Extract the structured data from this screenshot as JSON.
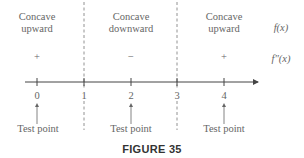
{
  "figure": {
    "caption": "FIGURE 35",
    "row_labels": {
      "function": "f(x)",
      "second_derivative": "f″(x)"
    },
    "intervals": [
      {
        "concavity_line1": "Concave",
        "concavity_line2": "upward",
        "sign": "+"
      },
      {
        "concavity_line1": "Concave",
        "concavity_line2": "downward",
        "sign": "−"
      },
      {
        "concavity_line1": "Concave",
        "concavity_line2": "upward",
        "sign": "+"
      }
    ],
    "ticks": [
      "0",
      "1",
      "2",
      "3",
      "4"
    ],
    "partition_points": [
      "1",
      "3"
    ],
    "test_points": [
      {
        "value": "0",
        "label": "Test point"
      },
      {
        "value": "2",
        "label": "Test point"
      },
      {
        "value": "4",
        "label": "Test point"
      }
    ]
  }
}
